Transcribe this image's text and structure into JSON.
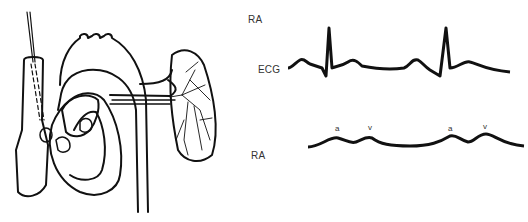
{
  "heart_diagram": {
    "description": "Line drawing of heart with catheter inserted via superior vena cava into right atrium; aorta, pulmonary vessels and lung shown"
  },
  "traces": {
    "top_label": "RA",
    "ecg_label": "ECG",
    "ra_label": "RA",
    "ra_wave_markers": [
      "a",
      "v",
      "a",
      "v"
    ]
  },
  "colors": {
    "line": "#111111",
    "background": "#ffffff"
  }
}
